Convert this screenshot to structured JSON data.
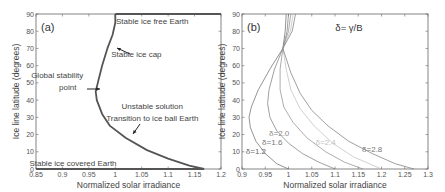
{
  "chart_data": [
    {
      "type": "line",
      "panel_label": "(a)",
      "xlabel": "Normalized solar irradiance",
      "ylabel": "Ice line latitude (degrees)",
      "xlim": [
        0.85,
        1.2
      ],
      "ylim": [
        0,
        90
      ],
      "xticks": [
        "0.85",
        "0.9",
        "0.95",
        "1",
        "1.05",
        "1.1",
        "1.15",
        "1.2"
      ],
      "yticks": [
        "0",
        "10",
        "20",
        "30",
        "40",
        "50",
        "60",
        "70",
        "80",
        "90"
      ],
      "grid": false,
      "series": [
        {
          "name": "Equilibrium ice line",
          "x": [
            1.0,
            1.0,
            0.995,
            0.985,
            0.975,
            0.967,
            0.963,
            0.965,
            0.975,
            0.99,
            1.02,
            1.06,
            1.1,
            1.14,
            1.168
          ],
          "y": [
            90,
            85,
            78,
            70,
            60,
            50,
            45,
            40,
            32,
            25,
            18,
            11,
            6,
            2,
            0
          ]
        },
        {
          "name": "Ice free branch",
          "x": [
            1.0,
            1.2
          ],
          "y": [
            90,
            90
          ]
        },
        {
          "name": "Ice covered branch",
          "x": [
            0.85,
            1.168
          ],
          "y": [
            0,
            0
          ]
        }
      ],
      "annotations": [
        {
          "text": "Stable ice free Earth",
          "x": 1.07,
          "y": 84
        },
        {
          "text": "Stable ice cap",
          "x": 1.04,
          "y": 65
        },
        {
          "text": "Global stability",
          "x": 0.89,
          "y": 53
        },
        {
          "text": "point",
          "x": 0.91,
          "y": 46
        },
        {
          "text": "Unstable solution",
          "x": 1.07,
          "y": 35
        },
        {
          "text": "Transition to ice ball Earth",
          "x": 1.07,
          "y": 28
        },
        {
          "text": "Stable ice covered Earth",
          "x": 0.92,
          "y": 2
        }
      ]
    },
    {
      "type": "line",
      "panel_label": "(b)",
      "title": "δ= γ/B",
      "xlabel": "Normalized solar irradiance",
      "ylabel": "Ice line latitude (degrees)",
      "xlim": [
        0.9,
        1.3
      ],
      "ylim": [
        0,
        90
      ],
      "xticks": [
        "0.9",
        "0.95",
        "1",
        "1.05",
        "1.1",
        "1.15",
        "1.2",
        "1.25",
        "1.3"
      ],
      "yticks": [
        "0",
        "10",
        "20",
        "30",
        "40",
        "50",
        "60",
        "70",
        "80",
        "90"
      ],
      "grid": false,
      "series": [
        {
          "name": "δ=1.2",
          "color": "#666666",
          "x": [
            0.995,
            0.993,
            0.988,
            0.96,
            0.935,
            0.92,
            0.915,
            0.918,
            0.93,
            0.95,
            0.975,
            1.0
          ],
          "y": [
            90,
            80,
            70,
            58,
            46,
            36,
            30,
            24,
            16,
            9,
            3,
            0
          ]
        },
        {
          "name": "δ=1.6",
          "color": "#777777",
          "x": [
            1.0,
            0.997,
            0.988,
            0.97,
            0.958,
            0.955,
            0.96,
            0.975,
            1.0,
            1.03,
            1.065,
            1.1
          ],
          "y": [
            90,
            80,
            70,
            58,
            46,
            38,
            30,
            22,
            15,
            9,
            4,
            0
          ]
        },
        {
          "name": "δ=2.0",
          "color": "#8a8a8a",
          "x": [
            1.005,
            1.0,
            0.988,
            0.982,
            0.982,
            0.99,
            1.01,
            1.04,
            1.08,
            1.12,
            1.16
          ],
          "y": [
            90,
            80,
            70,
            58,
            46,
            36,
            27,
            18,
            10,
            4,
            0
          ]
        },
        {
          "name": "δ=2.4",
          "color": "#bbbbbb",
          "x": [
            1.01,
            1.004,
            0.988,
            0.995,
            1.005,
            1.025,
            1.055,
            1.095,
            1.14,
            1.2
          ],
          "y": [
            90,
            80,
            70,
            58,
            46,
            35,
            25,
            15,
            7,
            0
          ]
        },
        {
          "name": "δ=2.8",
          "color": "#777777",
          "x": [
            1.015,
            1.008,
            0.988,
            1.005,
            1.025,
            1.05,
            1.085,
            1.13,
            1.18,
            1.23,
            1.27
          ],
          "y": [
            90,
            80,
            70,
            56,
            44,
            34,
            25,
            16,
            9,
            3,
            0
          ]
        }
      ],
      "annotations": [
        {
          "text": "δ=1.2",
          "x": 0.93,
          "y": 9
        },
        {
          "text": "δ=1.6",
          "x": 0.965,
          "y": 14
        },
        {
          "text": "δ=2.0",
          "x": 0.98,
          "y": 19
        },
        {
          "text": "δ=2.4",
          "x": 1.08,
          "y": 14
        },
        {
          "text": "δ=2.8",
          "x": 1.18,
          "y": 10
        }
      ]
    }
  ]
}
